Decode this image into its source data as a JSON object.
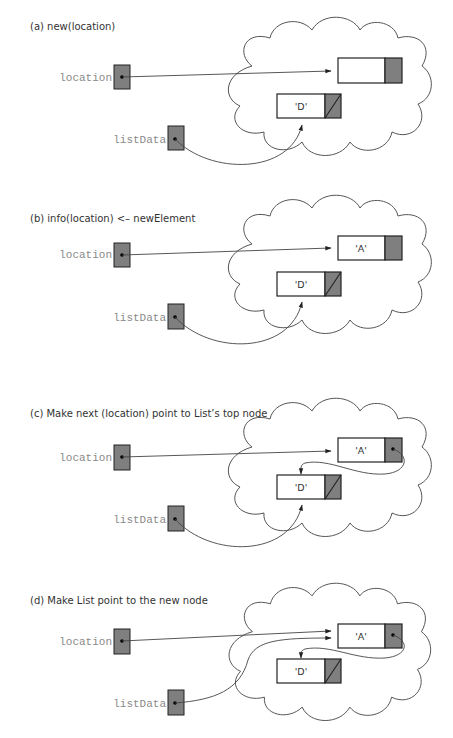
{
  "panels": [
    {
      "id": "a",
      "title": "(a) new(location)",
      "pointer_labels": {
        "location": "location",
        "listData": "listData"
      },
      "nodes": [
        {
          "name": "new-node",
          "info": "",
          "next": "unassigned"
        },
        {
          "name": "top-node",
          "info": "'D'",
          "next": "null"
        }
      ]
    },
    {
      "id": "b",
      "title": "(b) info(location) <– newElement",
      "pointer_labels": {
        "location": "location",
        "listData": "listData"
      },
      "nodes": [
        {
          "name": "new-node",
          "info": "'A'",
          "next": "unassigned"
        },
        {
          "name": "top-node",
          "info": "'D'",
          "next": "null"
        }
      ]
    },
    {
      "id": "c",
      "title": "(c) Make next (location) point to List’s top node",
      "pointer_labels": {
        "location": "location",
        "listData": "listData"
      },
      "nodes": [
        {
          "name": "new-node",
          "info": "'A'",
          "next": "top-node"
        },
        {
          "name": "top-node",
          "info": "'D'",
          "next": "null"
        }
      ]
    },
    {
      "id": "d",
      "title": "(d) Make List point to the new node",
      "pointer_labels": {
        "location": "location",
        "listData": "listData"
      },
      "nodes": [
        {
          "name": "new-node",
          "info": "'A'",
          "next": "top-node"
        },
        {
          "name": "top-node",
          "info": "'D'",
          "next": "null"
        }
      ]
    }
  ],
  "colors": {
    "pointer_fill": "#7f7f7f",
    "outline": "#222222",
    "label_gray": "#8a8a8a",
    "background": "#ffffff"
  }
}
